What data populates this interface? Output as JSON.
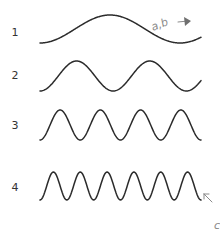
{
  "diagram": {
    "rows": [
      {
        "label": "1",
        "cycles": 1.15,
        "y_center": 29,
        "amplitude": 14,
        "label_y": 32
      },
      {
        "label": "2",
        "cycles": 2.2,
        "y_center": 76,
        "amplitude": 15,
        "label_y": 75
      },
      {
        "label": "3",
        "cycles": 4,
        "y_center": 125,
        "amplitude": 15,
        "label_y": 125
      },
      {
        "label": "4",
        "cycles": 6,
        "y_center": 186,
        "amplitude": 14,
        "label_y": 187
      }
    ],
    "annotations": {
      "wave1_note": "a,b",
      "wave4_note": "c"
    },
    "colors": {
      "wave": "#2b2b2b",
      "label": "#333333",
      "annotation": "#8a8a8a"
    }
  }
}
